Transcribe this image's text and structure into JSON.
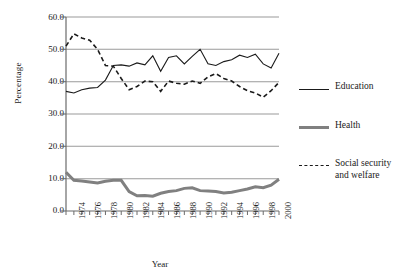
{
  "chart_data": {
    "type": "line",
    "title": "",
    "subtitle": "",
    "xlabel": "Year",
    "ylabel": "Percentage",
    "grid": true,
    "grid_orientation": "horizontal",
    "legend_position": "right",
    "xlim": [
      1973,
      2000
    ],
    "ylim": [
      0.0,
      60.0
    ],
    "ytick_labels": [
      "60.0",
      "50.0",
      "40.0",
      "30.0",
      "20.0",
      "10.0",
      "0.0"
    ],
    "ytick_values": [
      60.0,
      50.0,
      40.0,
      30.0,
      20.0,
      10.0,
      0.0
    ],
    "xtick_labels": [
      "1974",
      "1976",
      "1978",
      "1980",
      "1982",
      "1984",
      "1986",
      "1988",
      "1990",
      "1992",
      "1994",
      "1996",
      "1998",
      "2000"
    ],
    "xtick_values": [
      1974,
      1976,
      1978,
      1980,
      1982,
      1984,
      1986,
      1988,
      1990,
      1992,
      1994,
      1996,
      1998,
      2000
    ],
    "x": [
      1973,
      1974,
      1975,
      1976,
      1977,
      1978,
      1979,
      1980,
      1981,
      1982,
      1983,
      1984,
      1985,
      1986,
      1987,
      1988,
      1989,
      1990,
      1991,
      1992,
      1993,
      1994,
      1995,
      1996,
      1997,
      1998,
      1999,
      2000
    ],
    "series": [
      {
        "name": "Education",
        "style": "solid",
        "color": "#1a1a1a",
        "width": 1.1,
        "values": [
          37.0,
          36.5,
          37.5,
          38.0,
          38.2,
          40.5,
          45.0,
          45.2,
          44.8,
          45.8,
          45.2,
          48.0,
          43.2,
          47.5,
          48.0,
          45.5,
          47.8,
          50.0,
          45.5,
          45.0,
          46.2,
          46.8,
          48.2,
          47.5,
          48.5,
          45.5,
          44.2,
          48.8
        ]
      },
      {
        "name": "Health",
        "style": "solid",
        "color": "#808080",
        "width": 3.0,
        "values": [
          12.0,
          9.5,
          9.3,
          9.0,
          8.7,
          9.2,
          9.5,
          9.5,
          6.0,
          4.7,
          4.8,
          4.6,
          5.5,
          6.0,
          6.3,
          7.0,
          7.2,
          6.3,
          6.2,
          6.0,
          5.6,
          5.8,
          6.3,
          6.8,
          7.5,
          7.2,
          8.0,
          9.8
        ]
      },
      {
        "name": "Social security and welfare",
        "style": "dashed",
        "color": "#1a1a1a",
        "width": 1.6,
        "values": [
          51.0,
          54.8,
          53.5,
          52.8,
          50.0,
          45.0,
          44.8,
          41.0,
          37.5,
          38.5,
          40.2,
          40.0,
          37.0,
          40.2,
          39.5,
          39.2,
          40.2,
          39.5,
          41.5,
          42.5,
          41.0,
          40.2,
          38.5,
          37.2,
          36.5,
          35.2,
          37.2,
          39.8
        ]
      }
    ],
    "minor_ticks": true
  },
  "legend": {
    "items": [
      {
        "label": "Education",
        "swatch": "thin-solid-line-icon",
        "color": "#1a1a1a"
      },
      {
        "label": "Health",
        "swatch": "thick-gray-line-icon",
        "color": "#808080"
      },
      {
        "label": "Social security\nand welfare",
        "swatch": "dashed-line-icon",
        "color": "#1a1a1a",
        "line1": "Social security",
        "line2": "and welfare"
      }
    ]
  },
  "colors": {
    "education": "#1a1a1a",
    "health": "#808080",
    "social_security": "#1a1a1a",
    "gridline": "#9a9a9a",
    "axis": "#6b6b6b",
    "background": "#ffffff",
    "text": "#1a1a1a"
  }
}
